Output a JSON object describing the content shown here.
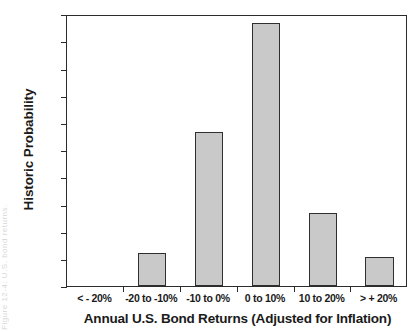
{
  "figure": {
    "edge_artifact_text": "Figure 12-4:  U.S. bond returns.",
    "background_color": "#ffffff",
    "bar_fill_color": "#c9c9c9",
    "bar_border_color": "#2f2f2f",
    "axis_color": "#2b2b2b"
  },
  "chart_data": {
    "type": "bar",
    "title": "",
    "xlabel": "Annual U.S. Bond Returns (Adjusted for Inflation)",
    "ylabel": "Historic Probability",
    "categories": [
      "< - 20%",
      "-20 to -10%",
      "-10 to 0%",
      "0 to 10%",
      "10 to 20%",
      "> + 20%"
    ],
    "values": [
      0,
      6.1,
      28.3,
      48.3,
      13.4,
      5.3
    ],
    "ylim": [
      0,
      50
    ],
    "ytick_labels": [
      "0%",
      "5%",
      "10%",
      "15%",
      "20%",
      "25%",
      "30%",
      "35%",
      "40%",
      "45%",
      "50%"
    ],
    "ytick_values": [
      0,
      5,
      10,
      15,
      20,
      25,
      30,
      35,
      40,
      45,
      50
    ],
    "grid": false,
    "legend": null,
    "value_unit": "%"
  }
}
